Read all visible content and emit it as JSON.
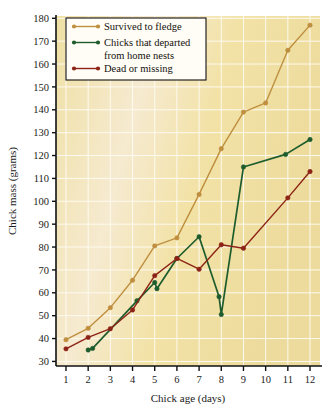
{
  "chart_data": {
    "type": "line",
    "title": "",
    "xlabel": "Chick age (days)",
    "ylabel": "Chick mass (grams)",
    "xlim": [
      0.55,
      12.45
    ],
    "ylim": [
      28,
      181
    ],
    "xticks": [
      1,
      2,
      3,
      4,
      5,
      6,
      7,
      8,
      9,
      10,
      11,
      12
    ],
    "yticks": [
      30,
      40,
      50,
      60,
      70,
      80,
      90,
      100,
      110,
      120,
      130,
      140,
      150,
      160,
      170,
      180
    ],
    "grid": true,
    "legend_position": "top-left",
    "plot_background": "#f2e3a8",
    "series": [
      {
        "name": "Survived to fledge",
        "color": "#bf8f3f",
        "marker": "circle",
        "x": [
          1,
          2,
          3,
          4,
          5,
          6,
          7,
          8,
          9,
          10,
          11,
          12
        ],
        "values": [
          39.5,
          44.5,
          53.5,
          65.5,
          80.5,
          84,
          103,
          123,
          139,
          143,
          166,
          177
        ]
      },
      {
        "name": "Chicks that departed from home nests",
        "color": "#1e5c2e",
        "marker": "circle",
        "x": [
          2,
          2.2,
          4.2,
          5,
          5.1,
          6,
          7,
          7.9,
          8,
          9,
          10.9,
          12
        ],
        "values": [
          35,
          35.7,
          56.5,
          64.5,
          61.8,
          75,
          84.5,
          58.3,
          50.5,
          115,
          120.5,
          127
        ]
      },
      {
        "name": "Dead or missing",
        "color": "#8c2316",
        "marker": "circle",
        "x": [
          1,
          2,
          3,
          4,
          5,
          6,
          7,
          8,
          9,
          11,
          12
        ],
        "values": [
          35.5,
          40.5,
          44.3,
          52.5,
          67.5,
          75,
          70.3,
          81,
          79.5,
          101.5,
          113
        ]
      }
    ]
  },
  "legend": {
    "items": [
      {
        "label": "Survived to fledge",
        "label2": "",
        "color": "#bf8f3f"
      },
      {
        "label": "Chicks that departed",
        "label2": "from home nests",
        "color": "#1e5c2e"
      },
      {
        "label": "Dead or missing",
        "label2": "",
        "color": "#8c2316"
      }
    ]
  },
  "axes": {
    "y_title": "Chick mass (grams)",
    "x_title": "Chick age (days)",
    "ytick_labels": [
      "180",
      "170",
      "160",
      "150",
      "140",
      "130",
      "120",
      "110",
      "100",
      "90",
      "80",
      "70",
      "60",
      "50",
      "40",
      "30"
    ],
    "xtick_labels": [
      "1",
      "2",
      "3",
      "4",
      "5",
      "6",
      "7",
      "8",
      "9",
      "10",
      "11",
      "12"
    ]
  }
}
